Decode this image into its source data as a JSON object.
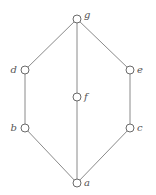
{
  "diagram": {
    "type": "hasse-diagram",
    "colors": {
      "edge": "#8a8a8a",
      "node_stroke": "#6a6a6a",
      "node_fill": "#ffffff",
      "label": "#555555",
      "background": "#ffffff"
    },
    "nodes": [
      {
        "id": "g",
        "label": "g",
        "x": 77,
        "y": 19,
        "label_side": "right"
      },
      {
        "id": "d",
        "label": "d",
        "x": 25,
        "y": 70,
        "label_side": "left"
      },
      {
        "id": "e",
        "label": "e",
        "x": 130,
        "y": 70,
        "label_side": "right"
      },
      {
        "id": "f",
        "label": "f",
        "x": 77,
        "y": 97,
        "label_side": "right"
      },
      {
        "id": "b",
        "label": "b",
        "x": 25,
        "y": 128,
        "label_side": "left"
      },
      {
        "id": "c",
        "label": "c",
        "x": 130,
        "y": 128,
        "label_side": "right"
      },
      {
        "id": "a",
        "label": "a",
        "x": 77,
        "y": 183,
        "label_side": "right"
      }
    ],
    "edges": [
      {
        "from": "g",
        "to": "d"
      },
      {
        "from": "g",
        "to": "f"
      },
      {
        "from": "g",
        "to": "e"
      },
      {
        "from": "d",
        "to": "b"
      },
      {
        "from": "e",
        "to": "c"
      },
      {
        "from": "b",
        "to": "a"
      },
      {
        "from": "f",
        "to": "a"
      },
      {
        "from": "c",
        "to": "a"
      }
    ]
  }
}
